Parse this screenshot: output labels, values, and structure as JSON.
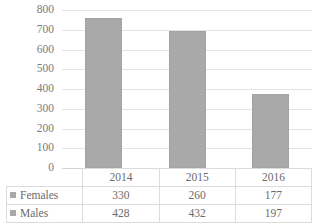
{
  "chart_data": {
    "type": "bar",
    "title": "",
    "subtitle": "",
    "xlabel": "",
    "ylabel": "",
    "categories": [
      "2014",
      "2015",
      "2016"
    ],
    "series": [
      {
        "name": "Females",
        "values": [
          330,
          260,
          177
        ]
      },
      {
        "name": "Males",
        "values": [
          428,
          432,
          197
        ]
      }
    ],
    "totals": [
      758,
      692,
      374
    ],
    "ylim": [
      0,
      800
    ],
    "ytick_step": 100,
    "yticks": [
      800,
      700,
      600,
      500,
      400,
      300,
      200,
      100,
      0
    ],
    "grid": true,
    "legend_position": "data-table-left",
    "data_table_visible": true,
    "bar_color": "#a9a9a9",
    "gridline_color": "#e4e4e4",
    "text_color": "#6b6b6b"
  },
  "table": {
    "header_row": [
      "2014",
      "2015",
      "2016"
    ],
    "rows": [
      {
        "label": "Females",
        "values": [
          "330",
          "260",
          "177"
        ]
      },
      {
        "label": "Males",
        "values": [
          "428",
          "432",
          "197"
        ]
      }
    ]
  }
}
